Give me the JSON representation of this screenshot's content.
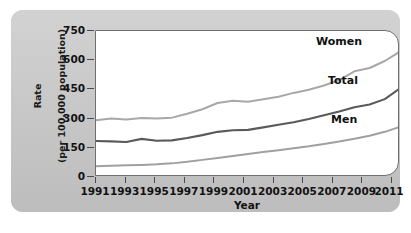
{
  "chart_data": {
    "type": "line",
    "title": "",
    "subtitle": "",
    "xlabel": "Year",
    "ylabel": "Rate (per 100,000 population)",
    "ylabel_line1": "Rate",
    "ylabel_line2": "(per 100,000 population)",
    "grid": false,
    "legend_position": "inline-right",
    "xlim": [
      1991,
      2011
    ],
    "ylim": [
      0,
      750
    ],
    "yticks": [
      0,
      150,
      300,
      450,
      600,
      750
    ],
    "ytick_labels": [
      "0",
      "150",
      "300",
      "450",
      "600",
      "750"
    ],
    "xticks": [
      1991,
      1993,
      1995,
      1997,
      1999,
      2001,
      2003,
      2005,
      2007,
      2009,
      2011
    ],
    "xtick_labels": [
      "1991",
      "1993",
      "1995",
      "1997",
      "1999",
      "2001",
      "2003",
      "2005",
      "2007",
      "2009",
      "2011"
    ],
    "x": [
      1991,
      1992,
      1993,
      1994,
      1995,
      1996,
      1997,
      1998,
      1999,
      2000,
      2001,
      2002,
      2003,
      2004,
      2005,
      2006,
      2007,
      2008,
      2009,
      2010,
      2011
    ],
    "series": [
      {
        "name": "Women",
        "color": "#a8a8a8",
        "values": [
          292,
          300,
          296,
          303,
          301,
          305,
          325,
          348,
          380,
          392,
          386,
          399,
          412,
          432,
          448,
          470,
          498,
          543,
          560,
          596,
          645
        ]
      },
      {
        "name": "Total",
        "color": "#5a5a5a",
        "values": [
          185,
          183,
          180,
          196,
          186,
          188,
          200,
          215,
          232,
          240,
          242,
          255,
          268,
          281,
          298,
          317,
          336,
          358,
          372,
          400,
          455
        ]
      },
      {
        "name": "Men",
        "color": "#a0a0a0",
        "values": [
          55,
          58,
          60,
          62,
          65,
          70,
          78,
          88,
          98,
          108,
          118,
          128,
          138,
          148,
          158,
          170,
          182,
          196,
          212,
          232,
          258
        ]
      }
    ],
    "annotations": [
      {
        "text": "Women",
        "series": "Women"
      },
      {
        "text": "Total",
        "series": "Total"
      },
      {
        "text": "Men",
        "series": "Men"
      }
    ],
    "colors": {
      "panel_background": "#c9c9c9",
      "plot_background": "#ffffff",
      "axis": "#4a4a4a",
      "text": "#121212"
    }
  }
}
